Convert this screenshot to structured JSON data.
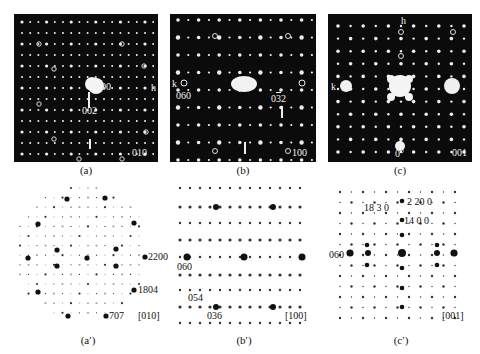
{
  "figure": {
    "panels_experimental": [
      {
        "id": "a",
        "caption": "(a)",
        "zone_axis": "010",
        "labels": {
          "spot1": "200",
          "spot2": "002",
          "axis_h": "h"
        }
      },
      {
        "id": "b",
        "caption": "(b)",
        "zone_axis": "100",
        "labels": {
          "spot1": "060",
          "spot2_prefix": "0",
          "spot2_bar": "3",
          "spot2_suffix": "2",
          "axis_k": "k"
        }
      },
      {
        "id": "c",
        "caption": "(c)",
        "zone_axis": "001",
        "labels": {
          "axis_h": "h",
          "axis_k": "k",
          "angle": "0°"
        }
      }
    ],
    "panels_simulated": [
      {
        "id": "a_prime",
        "caption": "(a′)",
        "zone_axis": "[010]",
        "labels": [
          "2200",
          "1804",
          "707"
        ]
      },
      {
        "id": "b_prime",
        "caption": "(b′)",
        "zone_axis": "[100]",
        "labels": [
          "060",
          "054",
          "036"
        ]
      },
      {
        "id": "c_prime",
        "caption": "(c′)",
        "zone_axis": "[001]",
        "labels": [
          "2 20 0",
          "18 3 0",
          "14 0 0",
          "060"
        ]
      }
    ]
  }
}
